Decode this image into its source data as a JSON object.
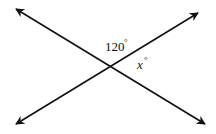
{
  "diagram": {
    "type": "intersecting-lines",
    "lines": [
      {
        "name": "line-a",
        "from": [
          16,
          9
        ],
        "to": [
          205,
          124
        ],
        "arrows": "both"
      },
      {
        "name": "line-b",
        "from": [
          16,
          124
        ],
        "to": [
          198,
          13
        ],
        "arrows": "both"
      }
    ],
    "intersection": [
      111,
      66
    ],
    "angles": [
      {
        "label": "120",
        "unit": "°",
        "position": "top"
      },
      {
        "label": "x",
        "unit": "°",
        "position": "right"
      }
    ],
    "colors": {
      "stroke": "#111111",
      "background": "#ffffff"
    }
  }
}
